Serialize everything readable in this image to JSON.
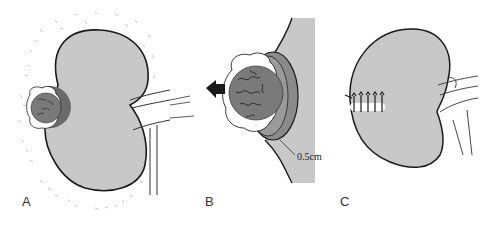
{
  "figure": {
    "panels": [
      {
        "id": "A",
        "label": "A",
        "description": "Kidney with exophytic tumor on lateral border surrounded by perirenal fat"
      },
      {
        "id": "B",
        "label": "B",
        "description": "Enucleation of tumor with margin of normal parenchyma; arrow indicates direction of removal",
        "margin_annotation": "0.5cm"
      },
      {
        "id": "C",
        "label": "C",
        "description": "Kidney after resection with sutured defect"
      }
    ],
    "colors": {
      "kidney_fill": "#c8c8c8",
      "tumor_fill": "#7a7a7a",
      "tumor_halo": "#6a6a6a",
      "outline": "#1a1a1a",
      "background": "#ffffff"
    },
    "icons": {
      "arrow": "left-arrow-icon"
    }
  }
}
